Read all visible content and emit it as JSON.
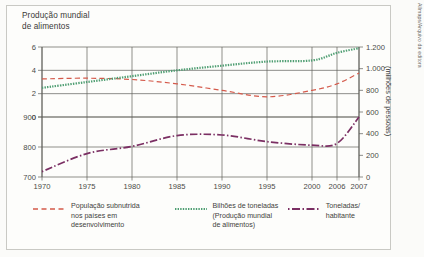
{
  "figure": {
    "title": "Produção mundial\nde alimentos",
    "credit": "Allmaps/Arquivo da editora",
    "right_axis_label": "(milhões de pessoas)"
  },
  "legend": {
    "items": [
      {
        "name": "legend-populacao-subnutrida",
        "label": "População subnutrida\nnos países em\ndesenvolvimento",
        "color": "#d4594a",
        "style": "dashed"
      },
      {
        "name": "legend-bilhoes-toneladas",
        "label": "Bilhões de toneladas\n(Produção mundial\nde alimentos)",
        "color": "#4e9e72",
        "style": "dotted"
      },
      {
        "name": "legend-toneladas-habitante",
        "label": "Toneladas/\nhabitante",
        "color": "#7b2f63",
        "style": "dashdot"
      }
    ]
  },
  "chart_data": {
    "type": "line",
    "title": "Produção mundial de alimentos",
    "xlabel": "",
    "ylabel": "",
    "grid": true,
    "legend_position": "bottom",
    "x": [
      1970,
      1975,
      1980,
      1985,
      1990,
      1995,
      2000,
      2006,
      2007
    ],
    "xticklabels": [
      "1970",
      "1975",
      "1980",
      "1985",
      "1990",
      "1995",
      "2000",
      "2006",
      "2007"
    ],
    "left_axis_upper": {
      "ticks": [
        0,
        2,
        4,
        6
      ],
      "ticklabels": [
        "0",
        "2",
        "4",
        "6"
      ],
      "range": [
        0,
        6
      ]
    },
    "left_axis_lower": {
      "ticks": [
        700,
        800,
        900
      ],
      "ticklabels": [
        "700",
        "800",
        "900"
      ],
      "range": [
        700,
        900
      ]
    },
    "right_axis": {
      "ticks": [
        0,
        200,
        400,
        600,
        800,
        1000,
        1200
      ],
      "ticklabels": [
        "0",
        "200",
        "400",
        "600",
        "800",
        "1.000",
        "1.200"
      ],
      "range": [
        0,
        1200
      ],
      "label": "(milhões de pessoas)"
    },
    "series": [
      {
        "name": "População subnutrida nos países em desenvolvimento",
        "unit": "milhões de pessoas",
        "axis": "right",
        "color": "#d4594a",
        "style": "dashed",
        "x": [
          1970,
          1975,
          1980,
          1985,
          1990,
          1995,
          2000,
          2006,
          2007
        ],
        "values": [
          905,
          912,
          900,
          860,
          800,
          740,
          800,
          860,
          960
        ]
      },
      {
        "name": "Bilhões de toneladas (Produção mundial de alimentos)",
        "unit": "bilhões de toneladas",
        "axis": "left-upper",
        "color": "#4e9e72",
        "style": "dotted",
        "x": [
          1970,
          1975,
          1980,
          1985,
          1990,
          1995,
          2000,
          2006,
          2007
        ],
        "values": [
          2.5,
          3.0,
          3.5,
          4.0,
          4.4,
          4.75,
          4.85,
          5.5,
          5.9
        ]
      },
      {
        "name": "Toneladas/habitante",
        "unit": "kg por habitante",
        "axis": "left-lower",
        "color": "#7b2f63",
        "style": "dashdot",
        "x": [
          1970,
          1975,
          1980,
          1985,
          1990,
          1995,
          2000,
          2006,
          2007
        ],
        "values": [
          718,
          778,
          802,
          838,
          840,
          818,
          806,
          812,
          900
        ]
      }
    ]
  }
}
